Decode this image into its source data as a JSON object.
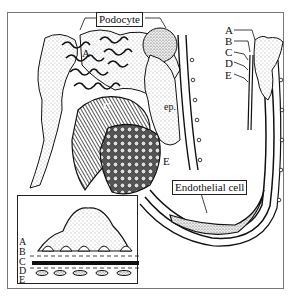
{
  "figure": {
    "type": "glomerular filtration barrier illustration",
    "labels": {
      "podocyte": "Podocyte",
      "endothelial_cell": "Endothelial cell",
      "A_main": "A",
      "C_main": "C",
      "ep": "ep.",
      "E_main": "E"
    },
    "right_key": [
      "A",
      "B",
      "C",
      "D",
      "E"
    ],
    "inset_key": [
      "A",
      "B",
      "C",
      "D",
      "E"
    ]
  },
  "colors": {
    "ink": "#111111",
    "frame": "#777777",
    "stipple": "#555555",
    "background": "#ffffff"
  }
}
